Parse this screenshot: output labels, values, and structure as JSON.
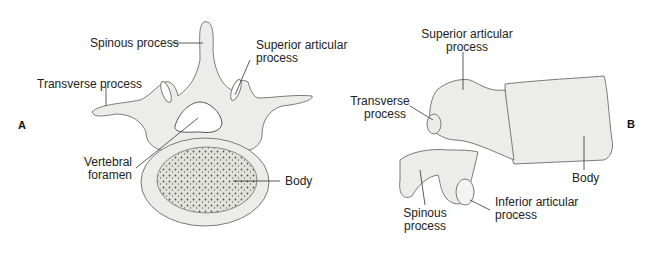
{
  "figure": {
    "panel_a": {
      "letter": "A",
      "view": "superior",
      "labels": {
        "spinous": "Spinous process",
        "superior_articular_l1": "Superior articular",
        "superior_articular_l2": "process",
        "transverse": "Transverse process",
        "foramen_l1": "Vertebral",
        "foramen_l2": "foramen",
        "body": "Body"
      }
    },
    "panel_b": {
      "letter": "B",
      "view": "lateral",
      "labels": {
        "superior_articular_l1": "Superior articular",
        "superior_articular_l2": "process",
        "transverse_l1": "Transverse",
        "transverse_l2": "process",
        "spinous_l1": "Spinous",
        "spinous_l2": "process",
        "inferior_articular_l1": "Inferior articular",
        "inferior_articular_l2": "process",
        "body": "Body"
      }
    },
    "colors": {
      "bone_fill": "#ecede8",
      "bone_stroke": "#7a7a76",
      "leader": "#333333",
      "text": "#222222"
    }
  }
}
